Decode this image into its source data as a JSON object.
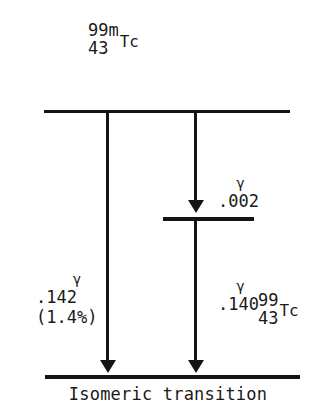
{
  "diagram": {
    "type": "nuclear-decay-scheme",
    "caption": "Isomeric transition",
    "parent_nuclide": {
      "mass_number": "99m",
      "atomic_number": "43",
      "symbol": "Tc"
    },
    "daughter_nuclide": {
      "mass_number": "99",
      "atomic_number": "43",
      "symbol": "Tc"
    },
    "gamma_symbol": "γ",
    "transitions": [
      {
        "id": "gamma-142",
        "gamma": "γ",
        "energy": ".142",
        "intensity": "(1.4%)"
      },
      {
        "id": "gamma-002",
        "gamma": "γ",
        "energy": ".002",
        "intensity": ""
      },
      {
        "id": "gamma-140",
        "gamma": "γ",
        "energy": ".140",
        "intensity": ""
      }
    ],
    "colors": {
      "ink": "#141414",
      "background": "#ffffff"
    }
  }
}
